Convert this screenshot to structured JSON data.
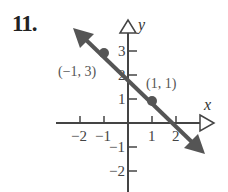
{
  "problem": {
    "number": "11."
  },
  "axes": {
    "x_label": "x",
    "y_label": "y"
  },
  "points": [
    {
      "label": "(−1, 3)",
      "x": -1,
      "y": 3
    },
    {
      "label": "(1, 1)",
      "x": 1,
      "y": 1
    }
  ],
  "x_ticks": [
    {
      "value": -2,
      "label": "−2"
    },
    {
      "value": -1,
      "label": "−1"
    },
    {
      "value": 1,
      "label": "1"
    },
    {
      "value": 2,
      "label": "2"
    }
  ],
  "y_ticks": [
    {
      "value": 3,
      "label": "3"
    },
    {
      "value": 2,
      "label": "2"
    },
    {
      "value": 1,
      "label": "1"
    },
    {
      "value": -1,
      "label": "−1"
    },
    {
      "value": -2,
      "label": "−2"
    }
  ],
  "colors": {
    "line": "#555555",
    "axis": "#444444",
    "point": "#555555"
  },
  "chart_data": {
    "type": "line",
    "title": "11.",
    "xlabel": "x",
    "ylabel": "y",
    "xlim": [
      -3,
      3
    ],
    "ylim": [
      -3,
      4
    ],
    "grid": false,
    "series": [
      {
        "name": "line through (-1,3) and (1,1)",
        "x": [
          -1,
          1
        ],
        "y": [
          3,
          1
        ],
        "equation": "y = -x + 2"
      }
    ],
    "annotations": [
      "(−1, 3)",
      "(1, 1)"
    ]
  }
}
